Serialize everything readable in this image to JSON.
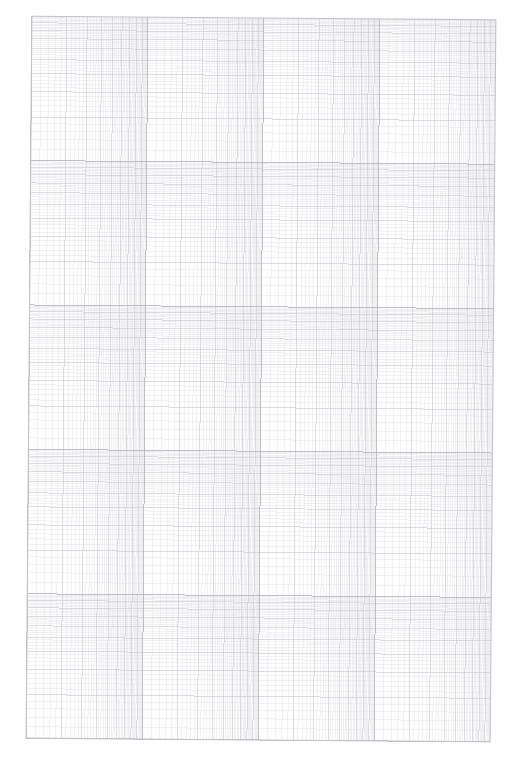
{
  "document": {
    "kind": "log-log-graph-paper",
    "title": "Logarithmic Graph Paper",
    "page_width": 514,
    "page_height": 780,
    "background_color": "#fefefe",
    "scan_skew_degrees": 0.45,
    "has_text_labels": false,
    "has_axis_numbers": false
  },
  "grid": {
    "plot_left": 29,
    "plot_top": 18,
    "plot_right": 493,
    "plot_bottom": 740,
    "x_scale": "log10",
    "y_scale": "log10",
    "x_decades": 4,
    "y_decades": 5,
    "mantissa_ticks": [
      1,
      2,
      3,
      4,
      5,
      6,
      7,
      8,
      9
    ],
    "minor_subdivisions_per_mantissa": 5,
    "x_decade_width_px": 116,
    "y_decade_height_px": 144.4,
    "border_color": "#c2c2c8",
    "decade_line_color": "#b8b8c0",
    "major_line_color": "#cccdd3",
    "minor_line_color": "#e2e3e8",
    "border_width_px": 1.1,
    "decade_line_width_px": 0.9,
    "major_line_width_px": 0.7,
    "minor_line_width_px": 0.45
  },
  "chart_data": {
    "type": "table",
    "title": "",
    "xlabel": "",
    "ylabel": "",
    "grid": true,
    "series": [],
    "note": "Blank logarithmic grid; no plotted data points, no tick labels, no legend."
  }
}
